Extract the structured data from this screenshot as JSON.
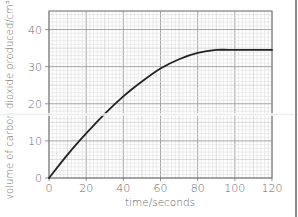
{
  "chart_data": {
    "type": "line",
    "title": "",
    "xlabel": "time/seconds",
    "ylabel": "volume of carbon dioxide produced/cm³",
    "xlim": [
      0,
      120
    ],
    "ylim": [
      0,
      45
    ],
    "x_ticks": [
      0,
      20,
      40,
      60,
      80,
      100,
      120
    ],
    "y_ticks": [
      0,
      10,
      20,
      30,
      40
    ],
    "x_tick_labels": [
      "0",
      "20",
      "40",
      "60",
      "80",
      "100",
      "120"
    ],
    "y_tick_labels": [
      "0",
      "10",
      "20",
      "30",
      "40"
    ],
    "grid": true,
    "grid_minor_x": 2,
    "grid_minor_y": 1,
    "legend": null,
    "series": [
      {
        "name": "volume of carbon dioxide",
        "color": "#222222",
        "x": [
          0,
          10,
          20,
          30,
          40,
          50,
          60,
          70,
          80,
          90,
          100,
          110,
          120
        ],
        "values": [
          0,
          6.3,
          12,
          17.3,
          22,
          26,
          29.5,
          32,
          33.7,
          34.5,
          34.5,
          34.5,
          34.5
        ]
      }
    ]
  },
  "colors": {
    "grid_major": "#9a9a9a",
    "grid_mid": "#c2c2c2",
    "grid_minor": "#dedede",
    "frame": "#777777",
    "curve": "#222222"
  }
}
